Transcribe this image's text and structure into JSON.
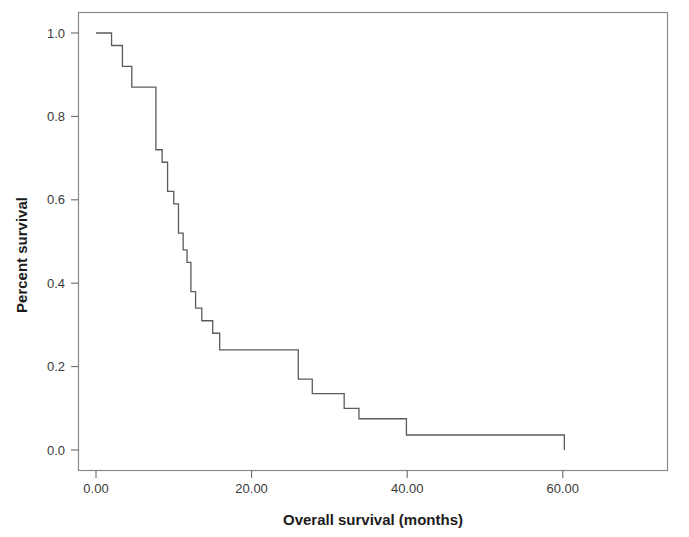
{
  "figure": {
    "background_color": "#ffffff",
    "frame_color": "#8a8a8a",
    "curve_color": "#5c5c5c"
  },
  "axes": {
    "x_title": "Overall survival (months)",
    "y_title": "Percent survival",
    "x_ticks": [
      "0.00",
      "20.00",
      "40.00",
      "60.00"
    ],
    "y_ticks": [
      "0.0",
      "0.2",
      "0.4",
      "0.6",
      "0.8",
      "1.0"
    ]
  },
  "chart_data": {
    "type": "line",
    "title": "",
    "subtitle": "",
    "xlabel": "Overall survival (months)",
    "ylabel": "Percent survival",
    "xlim": [
      -3.5,
      73.5
    ],
    "ylim": [
      -0.125,
      1.155
    ],
    "xticks": [
      0,
      20,
      40,
      60
    ],
    "xtick_labels": [
      "0.00",
      "20.00",
      "40.00",
      "60.00"
    ],
    "yticks": [
      0.0,
      0.2,
      0.4,
      0.6,
      0.8,
      1.0
    ],
    "ytick_labels": [
      "0.0",
      "0.2",
      "0.4",
      "0.6",
      "0.8",
      "1.0"
    ],
    "grid": false,
    "legend": null,
    "legend_position": "none",
    "annotations": [],
    "series": [
      {
        "name": "Overall survival",
        "style": "step-post",
        "color": "#5c5c5c",
        "x": [
          0.0,
          2.0,
          2.0,
          3.4,
          3.4,
          4.6,
          4.6,
          7.7,
          7.7,
          8.5,
          8.5,
          9.2,
          9.2,
          10.0,
          10.0,
          10.6,
          10.6,
          11.2,
          11.2,
          11.7,
          11.7,
          12.2,
          12.2,
          12.8,
          12.8,
          13.6,
          13.6,
          15.0,
          15.0,
          15.9,
          15.9,
          26.0,
          26.0,
          27.8,
          27.8,
          31.9,
          31.9,
          33.8,
          33.8,
          39.9,
          39.9,
          60.2,
          60.2
        ],
        "y": [
          1.0,
          1.0,
          0.97,
          0.97,
          0.92,
          0.92,
          0.87,
          0.87,
          0.72,
          0.72,
          0.69,
          0.69,
          0.62,
          0.62,
          0.59,
          0.59,
          0.52,
          0.52,
          0.48,
          0.48,
          0.45,
          0.45,
          0.38,
          0.38,
          0.34,
          0.34,
          0.31,
          0.31,
          0.28,
          0.28,
          0.24,
          0.24,
          0.17,
          0.17,
          0.135,
          0.135,
          0.1,
          0.1,
          0.075,
          0.075,
          0.036,
          0.036,
          0.0
        ],
        "steps": [
          {
            "time": 0.0,
            "survival": 1.0
          },
          {
            "time": 2.0,
            "survival": 0.97
          },
          {
            "time": 3.4,
            "survival": 0.92
          },
          {
            "time": 4.6,
            "survival": 0.87
          },
          {
            "time": 7.7,
            "survival": 0.72
          },
          {
            "time": 8.5,
            "survival": 0.69
          },
          {
            "time": 9.2,
            "survival": 0.62
          },
          {
            "time": 10.0,
            "survival": 0.59
          },
          {
            "time": 10.6,
            "survival": 0.52
          },
          {
            "time": 11.2,
            "survival": 0.48
          },
          {
            "time": 11.7,
            "survival": 0.45
          },
          {
            "time": 12.2,
            "survival": 0.38
          },
          {
            "time": 12.8,
            "survival": 0.34
          },
          {
            "time": 13.6,
            "survival": 0.31
          },
          {
            "time": 15.0,
            "survival": 0.28
          },
          {
            "time": 15.9,
            "survival": 0.24
          },
          {
            "time": 26.0,
            "survival": 0.17
          },
          {
            "time": 27.8,
            "survival": 0.135
          },
          {
            "time": 31.9,
            "survival": 0.1
          },
          {
            "time": 33.8,
            "survival": 0.075
          },
          {
            "time": 39.9,
            "survival": 0.036
          },
          {
            "time": 60.2,
            "survival": 0.0
          }
        ]
      }
    ]
  }
}
